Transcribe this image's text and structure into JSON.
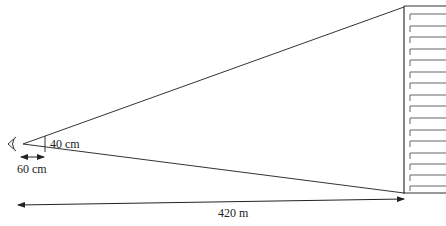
{
  "diagram": {
    "type": "viewing-cone geometry",
    "observer": {
      "icon": "eye-icon"
    },
    "labels": {
      "object_size": "40 cm",
      "object_distance": "60 cm",
      "building_distance": "420 m"
    },
    "building": {
      "window_rows": 16
    },
    "colors": {
      "line": "#333333",
      "window": "#666666",
      "background": "#ffffff"
    }
  }
}
